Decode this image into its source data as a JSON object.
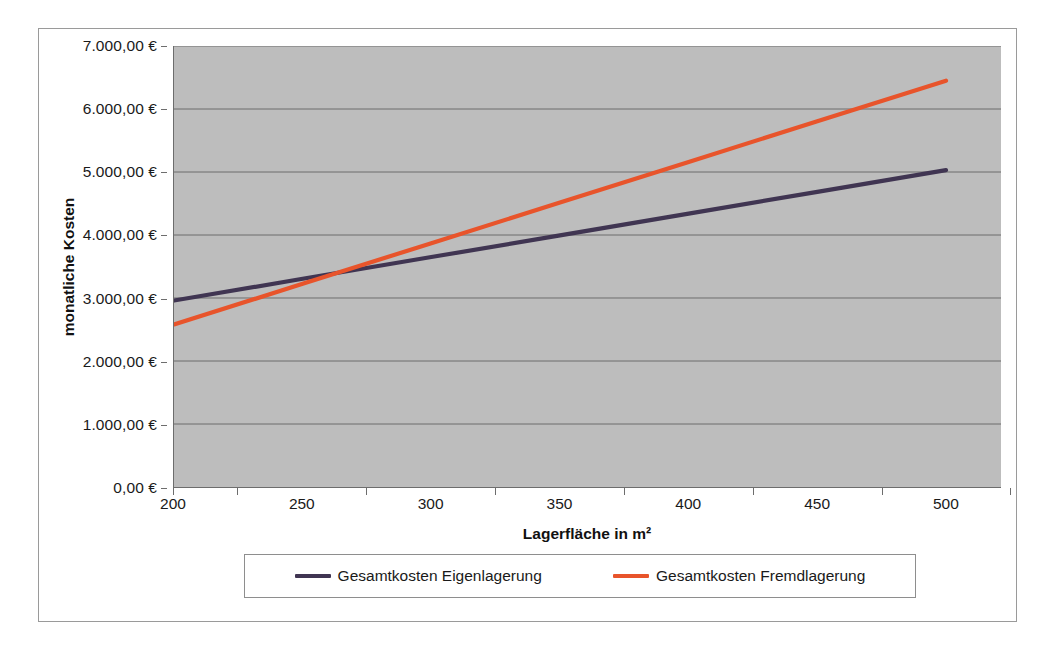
{
  "chart_data": {
    "type": "line",
    "title": "",
    "xlabel": "Lagerfläche in m²",
    "ylabel": "monatliche Kosten",
    "x": [
      200,
      250,
      300,
      350,
      400,
      450,
      500
    ],
    "xtick_labels": [
      "200",
      "250",
      "300",
      "350",
      "400",
      "450",
      "500"
    ],
    "ytick_labels": [
      "0,00 €",
      "1.000,00 €",
      "2.000,00 €",
      "3.000,00 €",
      "4.000,00 €",
      "5.000,00 €",
      "6.000,00 €",
      "7.000,00 €"
    ],
    "ytick_values": [
      0,
      1000,
      2000,
      3000,
      4000,
      5000,
      6000,
      7000
    ],
    "ylim": [
      0,
      7000
    ],
    "xlim": [
      200,
      500
    ],
    "grid": "horizontal",
    "legend_position": "bottom",
    "plot_background": "#bdbdbd",
    "series": [
      {
        "name": "Gesamtkosten Eigenlagerung",
        "color": "#403552",
        "values": [
          2960,
          3305,
          3650,
          3995,
          4340,
          4685,
          5030
        ]
      },
      {
        "name": "Gesamtkosten Fremdlagerung",
        "color": "#e8542b",
        "values": [
          2580,
          3225,
          3870,
          4515,
          5160,
          5805,
          6450
        ]
      }
    ]
  },
  "legend": {
    "items": [
      {
        "label": "Gesamtkosten Eigenlagerung",
        "color": "#403552"
      },
      {
        "label": "Gesamtkosten Fremdlagerung",
        "color": "#e8542b"
      }
    ]
  }
}
